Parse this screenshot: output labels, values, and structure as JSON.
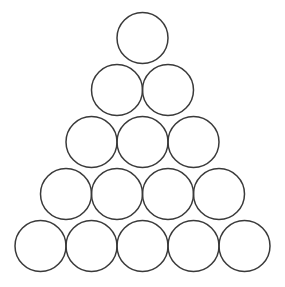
{
  "figure": {
    "background_color": "#ffffff",
    "stroke_color": "#3a3a3a",
    "fill_color": "none",
    "stroke_width": 1.5,
    "width": 285,
    "height": 287,
    "total_circles": 15,
    "rows": 5,
    "radius": 25.5,
    "diameter": 51,
    "row_spacing": 52,
    "arrangement": "triangular-stack"
  },
  "chart_data": {
    "type": "scatter",
    "xlabel": "",
    "ylabel": "",
    "xlim": [
      0,
      285
    ],
    "ylim": [
      287,
      0
    ],
    "grid": false,
    "legend": null,
    "marker": "circle-outline",
    "marker_radius": 25.5,
    "rows": [
      {
        "index": 1,
        "count": 1,
        "center_y": 38,
        "centers_x": [
          142.5
        ]
      },
      {
        "index": 2,
        "count": 2,
        "center_y": 90,
        "centers_x": [
          117.0,
          168.0
        ]
      },
      {
        "index": 3,
        "count": 3,
        "center_y": 142,
        "centers_x": [
          91.5,
          142.5,
          193.5
        ]
      },
      {
        "index": 4,
        "count": 4,
        "center_y": 194,
        "centers_x": [
          66.0,
          117.0,
          168.0,
          219.0
        ]
      },
      {
        "index": 5,
        "count": 5,
        "center_y": 246,
        "centers_x": [
          40.5,
          91.5,
          142.5,
          193.5,
          244.5
        ]
      }
    ],
    "circles": [
      {
        "id": "r1c1",
        "row": 1,
        "col": 1,
        "cx": 142.5,
        "cy": 38,
        "r": 25.5
      },
      {
        "id": "r2c1",
        "row": 2,
        "col": 1,
        "cx": 117.0,
        "cy": 90,
        "r": 25.5
      },
      {
        "id": "r2c2",
        "row": 2,
        "col": 2,
        "cx": 168.0,
        "cy": 90,
        "r": 25.5
      },
      {
        "id": "r3c1",
        "row": 3,
        "col": 1,
        "cx": 91.5,
        "cy": 142,
        "r": 25.5
      },
      {
        "id": "r3c2",
        "row": 3,
        "col": 2,
        "cx": 142.5,
        "cy": 142,
        "r": 25.5
      },
      {
        "id": "r3c3",
        "row": 3,
        "col": 3,
        "cx": 193.5,
        "cy": 142,
        "r": 25.5
      },
      {
        "id": "r4c1",
        "row": 4,
        "col": 1,
        "cx": 66.0,
        "cy": 194,
        "r": 25.5
      },
      {
        "id": "r4c2",
        "row": 4,
        "col": 2,
        "cx": 117.0,
        "cy": 194,
        "r": 25.5
      },
      {
        "id": "r4c3",
        "row": 4,
        "col": 3,
        "cx": 168.0,
        "cy": 194,
        "r": 25.5
      },
      {
        "id": "r4c4",
        "row": 4,
        "col": 4,
        "cx": 219.0,
        "cy": 194,
        "r": 25.5
      },
      {
        "id": "r5c1",
        "row": 5,
        "col": 1,
        "cx": 40.5,
        "cy": 246,
        "r": 25.5
      },
      {
        "id": "r5c2",
        "row": 5,
        "col": 2,
        "cx": 91.5,
        "cy": 246,
        "r": 25.5
      },
      {
        "id": "r5c3",
        "row": 5,
        "col": 3,
        "cx": 142.5,
        "cy": 246,
        "r": 25.5
      },
      {
        "id": "r5c4",
        "row": 5,
        "col": 4,
        "cx": 193.5,
        "cy": 246,
        "r": 25.5
      },
      {
        "id": "r5c5",
        "row": 5,
        "col": 5,
        "cx": 244.5,
        "cy": 246,
        "r": 25.5
      }
    ],
    "counts_per_row": [
      1,
      2,
      3,
      4,
      5
    ],
    "values": [
      1,
      2,
      3,
      4,
      5
    ],
    "categories": [
      "Row 1",
      "Row 2",
      "Row 3",
      "Row 4",
      "Row 5"
    ]
  }
}
